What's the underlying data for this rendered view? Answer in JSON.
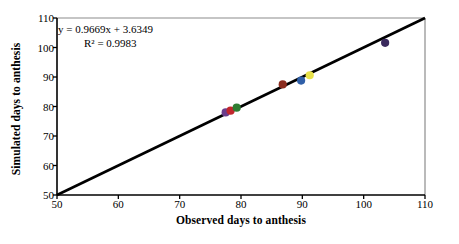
{
  "chart_data": {
    "type": "scatter",
    "title": "",
    "xlabel": "Observed days to anthesis",
    "ylabel": "Simulated days to anthesis",
    "xlim": [
      50,
      110
    ],
    "ylim": [
      50,
      110
    ],
    "xticks": [
      50,
      60,
      70,
      80,
      90,
      100,
      110
    ],
    "yticks": [
      50,
      60,
      70,
      80,
      90,
      100,
      110
    ],
    "grid": false,
    "legend": "none",
    "annotations": {
      "equation": "y = 0.9669x + 3.6349",
      "r_squared": "R² = 0.9983"
    },
    "reference_line": {
      "name": "1:1 line",
      "x": [
        50,
        110
      ],
      "y": [
        50,
        110
      ],
      "color": "#000000"
    },
    "points": [
      {
        "x": 77.5,
        "y": 78.0,
        "color": "#6b3d8c"
      },
      {
        "x": 78.3,
        "y": 78.6,
        "color": "#c1272d"
      },
      {
        "x": 79.3,
        "y": 79.6,
        "color": "#2f7d32"
      },
      {
        "x": 86.8,
        "y": 87.5,
        "color": "#8a2b1e"
      },
      {
        "x": 89.8,
        "y": 88.8,
        "color": "#2f5fa8"
      },
      {
        "x": 91.2,
        "y": 90.6,
        "color": "#e8e24a"
      },
      {
        "x": 103.5,
        "y": 101.6,
        "color": "#3b2a5e"
      }
    ]
  },
  "axes": {
    "x_tick_labels": [
      "50",
      "60",
      "70",
      "80",
      "90",
      "100",
      "110"
    ],
    "y_tick_labels": [
      "50",
      "60",
      "70",
      "80",
      "90",
      "100",
      "110"
    ]
  },
  "colors": {
    "axis": "#000000",
    "frame": "#808080",
    "background": "#ffffff"
  }
}
